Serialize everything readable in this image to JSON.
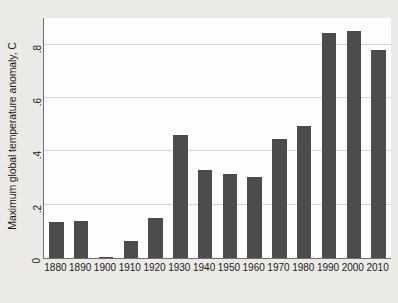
{
  "chart_data": {
    "type": "bar",
    "title": "",
    "subtitle": "",
    "xlabel": "",
    "ylabel": "Maximum global temperature anomaly, C",
    "categories": [
      "1880",
      "1890",
      "1900",
      "1910",
      "1920",
      "1930",
      "1940",
      "1950",
      "1960",
      "1970",
      "1980",
      "1990",
      "2000",
      "2010"
    ],
    "values": [
      0.135,
      0.14,
      0.005,
      0.065,
      0.15,
      0.46,
      0.33,
      0.315,
      0.305,
      0.445,
      0.495,
      0.845,
      0.85,
      0.78
    ],
    "ylim": [
      0,
      0.9
    ],
    "yticks": [
      "0",
      ".2",
      ".4",
      ".6",
      ".8"
    ],
    "ytick_values": [
      0,
      0.2,
      0.4,
      0.6,
      0.8
    ],
    "gridlines": [
      0.2,
      0.4,
      0.6,
      0.8
    ],
    "grid": true,
    "legend": "none",
    "bar_color": "#4c4c4c",
    "plot_background": "#fdfdfd",
    "figure_background": "#eceae7",
    "grid_color": "#d5d5d5",
    "axis_color": "#6f6f6f"
  }
}
